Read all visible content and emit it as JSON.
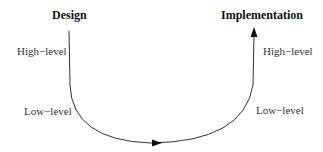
{
  "diagram": {
    "left": {
      "title": "Design",
      "labels": [
        "High−level",
        "Low−level"
      ]
    },
    "right": {
      "title": "Implementation",
      "labels": [
        "High−level",
        "Low−level"
      ]
    },
    "colors": {
      "line": "#333333",
      "text": "#222222",
      "background": "#ffffff"
    }
  }
}
